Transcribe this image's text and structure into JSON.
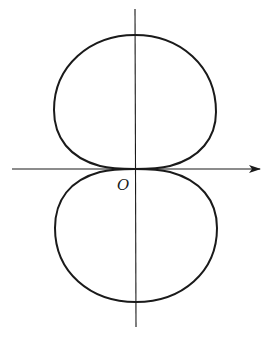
{
  "figure": {
    "type": "polar-curve-diagram",
    "origin_label": "O",
    "stroke_color": "#1a1a1a",
    "background": "#ffffff",
    "axes": {
      "horizontal": {
        "arrow": true,
        "direction": "right"
      },
      "vertical": {
        "arrow": false
      }
    }
  }
}
